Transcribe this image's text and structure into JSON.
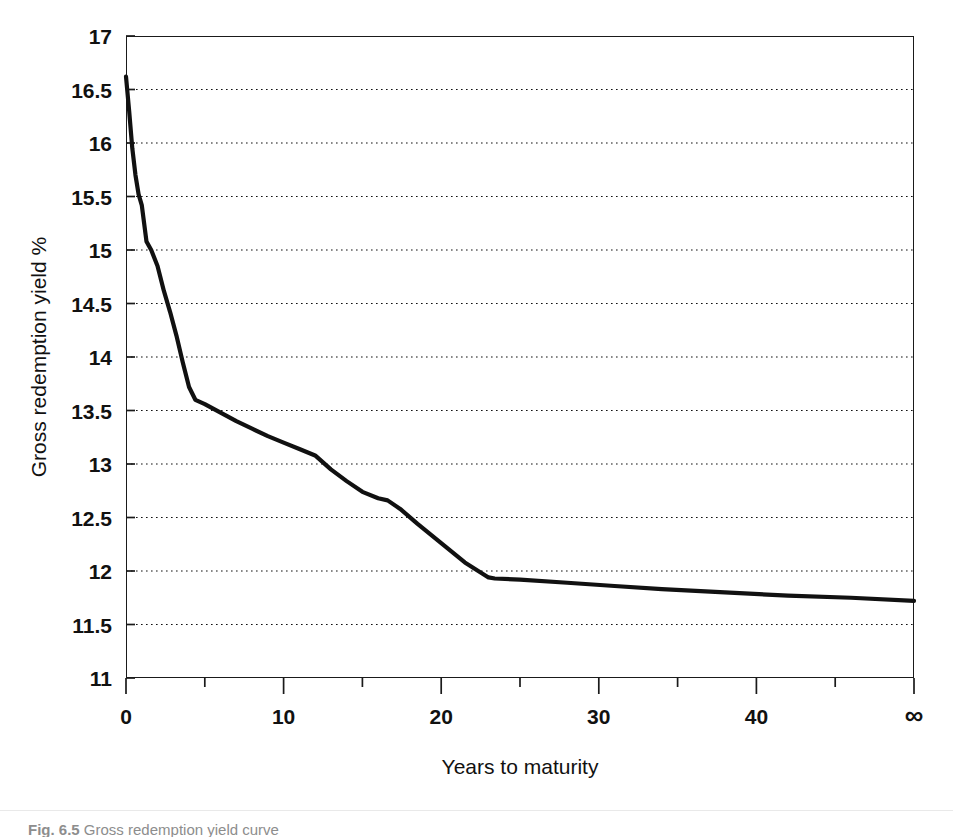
{
  "figure": {
    "background_color": "#ffffff",
    "ink_color": "#111111",
    "caption_label": "Fig. 6.5",
    "caption_text": "Gross redemption yield curve"
  },
  "axes": {
    "y_title": "Gross redemption yield %",
    "x_title": "Years to maturity",
    "y_ticks": [
      "17",
      "16.5",
      "16",
      "15.5",
      "15",
      "14.5",
      "14",
      "13.5",
      "13",
      "12.5",
      "12",
      "11.5",
      "11"
    ],
    "y_tick_values": [
      17,
      16.5,
      16,
      15.5,
      15,
      14.5,
      14,
      13.5,
      13,
      12.5,
      12,
      11.5,
      11
    ],
    "x_ticks": [
      "0",
      "10",
      "20",
      "30",
      "40",
      "∞"
    ],
    "x_tick_values": [
      0,
      10,
      20,
      30,
      40,
      50
    ],
    "x_minor_tick_values": [
      5,
      15,
      25,
      35,
      45
    ]
  },
  "chart_data": {
    "type": "line",
    "title": "",
    "xlabel": "Years to maturity",
    "ylabel": "Gross redemption yield %",
    "xlim": [
      0,
      50
    ],
    "ylim": [
      11,
      17
    ],
    "grid": true,
    "grid_style": "dotted-horizontal",
    "legend": null,
    "x_axis_note": "Last x tick is labelled infinity (undated / irredeemable stocks) and is positioned where 50 would fall.",
    "series": [
      {
        "name": "Gross redemption yield",
        "color": "#111111",
        "x": [
          0.0,
          0.2,
          0.4,
          0.6,
          0.8,
          1.0,
          1.3,
          1.6,
          2.0,
          2.4,
          2.8,
          3.2,
          3.6,
          4.0,
          4.4,
          5.0,
          6.0,
          7.0,
          8.0,
          9.0,
          10.0,
          11.0,
          12.0,
          13.0,
          14.0,
          15.0,
          16.0,
          16.6,
          17.4,
          18.5,
          20.0,
          21.5,
          23.0,
          23.4,
          25.0,
          28.0,
          31.0,
          34.0,
          38.0,
          42.0,
          46.0,
          50.0
        ],
        "y": [
          16.62,
          16.3,
          15.95,
          15.7,
          15.52,
          15.42,
          15.08,
          15.0,
          14.85,
          14.62,
          14.42,
          14.2,
          13.95,
          13.72,
          13.6,
          13.56,
          13.48,
          13.4,
          13.33,
          13.26,
          13.2,
          13.14,
          13.08,
          12.95,
          12.84,
          12.74,
          12.68,
          12.66,
          12.58,
          12.44,
          12.26,
          12.08,
          11.94,
          11.93,
          11.92,
          11.89,
          11.86,
          11.83,
          11.8,
          11.77,
          11.75,
          11.72
        ]
      }
    ],
    "annotations": [
      {
        "text": "Yield falls very steeply over the first year, from about 16.6% to about 15.4%."
      },
      {
        "text": "A shoulder forms near 4-5 years at about 13.55%."
      },
      {
        "text": "Curve flattens from about 23 years at about 11.9%, easing to about 11.7% at infinity."
      }
    ]
  }
}
